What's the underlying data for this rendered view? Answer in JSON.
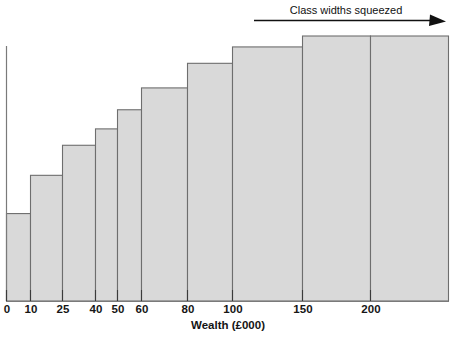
{
  "chart_data": {
    "type": "bar",
    "title": "",
    "subtitle": "",
    "xlabel": "Wealth (£000)",
    "ylabel": "",
    "grid": false,
    "legend": false,
    "legend_position": "none",
    "note": "Histogram of wealth with unequal (progressively wider) class intervals drawn on a squeezed axis, so equal pixel widths represent increasingly large wealth ranges.",
    "xlim": [
      0,
      250
    ],
    "ylim": [
      0,
      1
    ],
    "x_tick_labels": [
      "0",
      "10",
      "25",
      "40",
      "50",
      "60",
      "80",
      "100",
      "150",
      "200"
    ],
    "x_tick_values": [
      0,
      10,
      25,
      40,
      50,
      60,
      80,
      100,
      150,
      200
    ],
    "y_tick_labels": [],
    "bin_edges": [
      0,
      10,
      25,
      40,
      50,
      60,
      80,
      100,
      150,
      200,
      250
    ],
    "categories": [
      "0–10",
      "10–25",
      "25–40",
      "40–50",
      "50–60",
      "60–80",
      "80–100",
      "100–150",
      "150–200",
      "200+"
    ],
    "values": [
      32,
      46,
      57,
      63,
      70,
      78,
      87,
      93,
      97,
      97
    ],
    "annotations": [
      {
        "text": "Class widths squeezed",
        "arrow": "right"
      }
    ],
    "colors": {
      "bar_fill": "#d9d9d9",
      "bar_stroke": "#6e6e6e",
      "axis": "#7a7a7a",
      "tick": "#3a3a3a",
      "text": "#141414",
      "annotation": "#111111",
      "background": "#ffffff"
    }
  },
  "axis": {
    "x_title": "Wealth (£000)"
  },
  "annotation": {
    "label": "Class widths squeezed",
    "arrow_icon": "arrow-right-icon"
  },
  "ticks": [
    {
      "label": "0"
    },
    {
      "label": "10"
    },
    {
      "label": "25"
    },
    {
      "label": "40"
    },
    {
      "label": "50"
    },
    {
      "label": "60"
    },
    {
      "label": "80"
    },
    {
      "label": "100"
    },
    {
      "label": "150"
    },
    {
      "label": "200"
    }
  ]
}
